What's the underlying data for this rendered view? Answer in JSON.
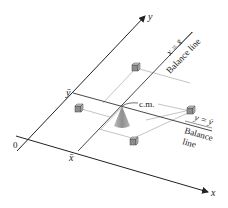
{
  "diagram": {
    "axes": {
      "x_label": "x",
      "y_label": "y",
      "origin_label": "0"
    },
    "marks": {
      "x_bar": "x̄",
      "y_bar": "ȳ"
    },
    "balance_lines": [
      {
        "equation": "x = x̄",
        "caption": "Balance line"
      },
      {
        "equation": "y = ȳ",
        "caption_line1": "Balance",
        "caption_line2": "line"
      }
    ],
    "center_of_mass_label": "c.m.",
    "masses": 4,
    "colors": {
      "axis": "#222222",
      "guide": "#9a9a9a",
      "cube": "#8c8c8c",
      "cone": "#9b9b9b"
    }
  }
}
